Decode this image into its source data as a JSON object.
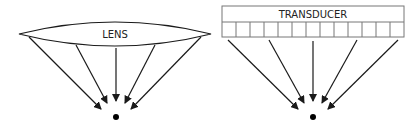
{
  "diagram": {
    "left": {
      "title": "Lens focusing",
      "element_label": "LENS",
      "shape": "biconvex-lens",
      "ray_count": 5,
      "focal_point": "dot"
    },
    "right": {
      "title": "Transducer array focusing",
      "element_label": "TRANSDUCER",
      "shape": "rectangular-array",
      "element_count": 13,
      "ray_count": 5,
      "focal_point": "dot"
    }
  },
  "colors": {
    "stroke": "#1a1a1a",
    "cell_stroke": "#666666",
    "background": "#ffffff"
  }
}
